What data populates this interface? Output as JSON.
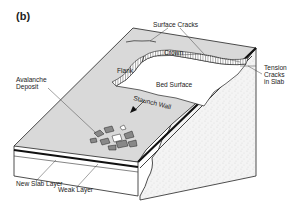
{
  "figure": {
    "panel_label": "(b)",
    "labels": {
      "surface_cracks": "Surface Cracks",
      "crown": "Crown",
      "flank": "Flank",
      "bed_surface": "Bed Surface",
      "staunch_wall": "Staunch Wall",
      "avalanche_deposit_1": "Avalanche",
      "avalanche_deposit_2": "Deposit",
      "tension_1": "Tension",
      "tension_2": "Cracks",
      "tension_3": "in Slab",
      "new_slab_layer": "New Slab Layer",
      "weak_layer": "Weak Layer"
    }
  },
  "colors": {
    "slab_surface": "#d9d9d9",
    "bed_surface": "#ffffff",
    "ground": "#f2f2f2",
    "line": "#222222"
  }
}
